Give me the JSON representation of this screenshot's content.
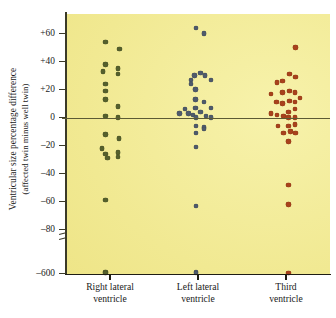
{
  "axes": {
    "y_title_line1": "Ventricular size percentage difference",
    "y_title_line2": "(affected twin minus well twin)",
    "y_ticks": [
      {
        "label": "+60",
        "value": 60
      },
      {
        "label": "+40",
        "value": 40
      },
      {
        "label": "+20",
        "value": 20
      },
      {
        "label": "0",
        "value": 0
      },
      {
        "label": "–20",
        "value": -20
      },
      {
        "label": "–40",
        "value": -40
      },
      {
        "label": "–60",
        "value": -60
      },
      {
        "label": "–80",
        "value": -80
      },
      {
        "label": "–600",
        "value": -600
      }
    ],
    "axis_break": true,
    "zero_reference_line": true
  },
  "categories": [
    {
      "line1": "Right lateral",
      "line2": "ventricle"
    },
    {
      "line1": "Left lateral",
      "line2": "ventricle"
    },
    {
      "line1": "Third",
      "line2": "ventricle"
    }
  ],
  "colors": {
    "plot_background": "#f2eb96",
    "series_right_lateral": "#55602c",
    "series_left_lateral": "#4f5a6b",
    "series_third": "#a8421c",
    "axis": "#1e1d14",
    "zero_line": "#5c5a34"
  },
  "chart_data": {
    "type": "scatter",
    "title": "",
    "xlabel": "",
    "ylabel": "Ventricular size percentage difference (affected twin minus well twin)",
    "ylim": [
      -600,
      72
    ],
    "grid": false,
    "legend": "none",
    "axis_break_between": [
      -80,
      -600
    ],
    "annotations": [
      "Horizontal reference line drawn at y = 0"
    ],
    "series": [
      {
        "name": "Right lateral ventricle",
        "color": "#55602c",
        "x_category": "Right lateral ventricle",
        "points": [
          {
            "jitter": -0.1,
            "value": 54
          },
          {
            "jitter": 0.22,
            "value": 49
          },
          {
            "jitter": -0.1,
            "value": 38
          },
          {
            "jitter": 0.18,
            "value": 35
          },
          {
            "jitter": -0.16,
            "value": 33
          },
          {
            "jitter": 0.18,
            "value": 31
          },
          {
            "jitter": -0.1,
            "value": 24
          },
          {
            "jitter": -0.1,
            "value": 19
          },
          {
            "jitter": -0.1,
            "value": 13
          },
          {
            "jitter": 0.18,
            "value": 8
          },
          {
            "jitter": -0.1,
            "value": 1
          },
          {
            "jitter": 0.18,
            "value": 0
          },
          {
            "jitter": -0.1,
            "value": -12
          },
          {
            "jitter": 0.2,
            "value": -15
          },
          {
            "jitter": -0.18,
            "value": -22
          },
          {
            "jitter": -0.1,
            "value": -26
          },
          {
            "jitter": 0.18,
            "value": -25
          },
          {
            "jitter": -0.06,
            "value": -29
          },
          {
            "jitter": 0.18,
            "value": -28
          },
          {
            "jitter": -0.1,
            "value": -59
          },
          {
            "jitter": -0.1,
            "value": -580
          },
          {
            "jitter": -0.1,
            "value": -592
          }
        ]
      },
      {
        "name": "Left lateral ventricle",
        "color": "#4f5a6b",
        "x_category": "Left lateral ventricle",
        "points": [
          {
            "jitter": -0.04,
            "value": 64
          },
          {
            "jitter": 0.14,
            "value": 60
          },
          {
            "jitter": -0.08,
            "value": 30
          },
          {
            "jitter": -0.16,
            "value": 27
          },
          {
            "jitter": 0.06,
            "value": 32
          },
          {
            "jitter": 0.16,
            "value": 30
          },
          {
            "jitter": 0.3,
            "value": 27
          },
          {
            "jitter": -0.16,
            "value": 24
          },
          {
            "jitter": -0.06,
            "value": 20
          },
          {
            "jitter": 0.14,
            "value": 11
          },
          {
            "jitter": -0.06,
            "value": 13
          },
          {
            "jitter": -0.06,
            "value": 7
          },
          {
            "jitter": 0.06,
            "value": 4
          },
          {
            "jitter": 0.3,
            "value": 7
          },
          {
            "jitter": -0.3,
            "value": 6
          },
          {
            "jitter": -0.42,
            "value": 3
          },
          {
            "jitter": -0.22,
            "value": 3
          },
          {
            "jitter": -0.12,
            "value": 2
          },
          {
            "jitter": -0.04,
            "value": 0
          },
          {
            "jitter": 0.18,
            "value": 1
          },
          {
            "jitter": 0.3,
            "value": 0
          },
          {
            "jitter": -0.04,
            "value": -6
          },
          {
            "jitter": 0.14,
            "value": -7
          },
          {
            "jitter": -0.04,
            "value": -11
          },
          {
            "jitter": 0.14,
            "value": -8
          },
          {
            "jitter": -0.04,
            "value": -21
          },
          {
            "jitter": -0.04,
            "value": -63
          },
          {
            "jitter": -0.04,
            "value": -580
          },
          {
            "jitter": -0.04,
            "value": -592
          }
        ]
      },
      {
        "name": "Third ventricle",
        "color": "#a8421c",
        "x_category": "Third ventricle",
        "points": [
          {
            "jitter": 0.22,
            "value": 50
          },
          {
            "jitter": 0.08,
            "value": 31
          },
          {
            "jitter": 0.22,
            "value": 29
          },
          {
            "jitter": -0.08,
            "value": 26
          },
          {
            "jitter": -0.2,
            "value": 25
          },
          {
            "jitter": 0.08,
            "value": 19
          },
          {
            "jitter": 0.2,
            "value": 18
          },
          {
            "jitter": -0.08,
            "value": 18
          },
          {
            "jitter": -0.34,
            "value": 17
          },
          {
            "jitter": 0.32,
            "value": 14
          },
          {
            "jitter": -0.22,
            "value": 11
          },
          {
            "jitter": 0.08,
            "value": 12
          },
          {
            "jitter": 0.2,
            "value": 11
          },
          {
            "jitter": -0.08,
            "value": 10
          },
          {
            "jitter": 0.2,
            "value": 6
          },
          {
            "jitter": 0.06,
            "value": 4
          },
          {
            "jitter": -0.34,
            "value": 3
          },
          {
            "jitter": -0.2,
            "value": 2
          },
          {
            "jitter": -0.06,
            "value": 1
          },
          {
            "jitter": 0.06,
            "value": 0
          },
          {
            "jitter": 0.2,
            "value": 0
          },
          {
            "jitter": -0.18,
            "value": -6
          },
          {
            "jitter": 0.06,
            "value": -6
          },
          {
            "jitter": 0.2,
            "value": -5
          },
          {
            "jitter": -0.06,
            "value": -11
          },
          {
            "jitter": 0.1,
            "value": -10
          },
          {
            "jitter": 0.22,
            "value": -11
          },
          {
            "jitter": 0.06,
            "value": -17
          },
          {
            "jitter": 0.06,
            "value": -48
          },
          {
            "jitter": 0.06,
            "value": -62
          },
          {
            "jitter": 0.06,
            "value": -590
          }
        ]
      }
    ]
  }
}
